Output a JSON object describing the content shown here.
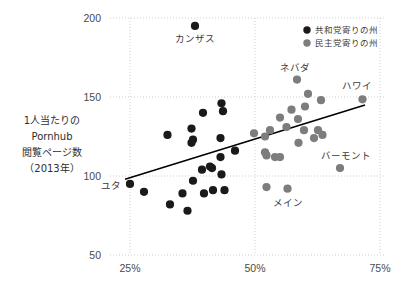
{
  "chart_data": {
    "type": "scatter",
    "title": "",
    "xlabel": "",
    "ylabel": "1人当たりのPornhub閲覧ページ数（2013年）",
    "xlim": [
      21,
      76
    ],
    "ylim": [
      50,
      200
    ],
    "xtick_labels": [
      "25%",
      "50%",
      "75%"
    ],
    "xtick_values": [
      25,
      50,
      75
    ],
    "ytick_labels": [
      "200",
      "150",
      "100",
      "50"
    ],
    "ytick_values": [
      200,
      150,
      100,
      50
    ],
    "grid": true,
    "legend_position": "top-right",
    "colors": {
      "republican": "#1a1a1a",
      "democrat": "#7d7d7d",
      "trendline": "#000000",
      "gridline": "#cfcfcf",
      "background": "#ffffff"
    },
    "series": [
      {
        "name": "共和党寄りの州",
        "color": "#1a1a1a",
        "points": [
          {
            "x": 38.0,
            "y": 195.0,
            "label": "カンザス"
          },
          {
            "x": 25.0,
            "y": 95.0,
            "label": "ユタ"
          },
          {
            "x": 27.8,
            "y": 90.0
          },
          {
            "x": 32.5,
            "y": 126.0
          },
          {
            "x": 33.0,
            "y": 82.0
          },
          {
            "x": 35.5,
            "y": 89.0
          },
          {
            "x": 36.5,
            "y": 78.0
          },
          {
            "x": 37.3,
            "y": 130.0
          },
          {
            "x": 37.3,
            "y": 121.0
          },
          {
            "x": 37.6,
            "y": 123.0
          },
          {
            "x": 37.6,
            "y": 97.0
          },
          {
            "x": 39.6,
            "y": 140.0
          },
          {
            "x": 39.4,
            "y": 104.0
          },
          {
            "x": 39.8,
            "y": 89.0
          },
          {
            "x": 41.0,
            "y": 106.0
          },
          {
            "x": 41.4,
            "y": 105.0
          },
          {
            "x": 41.6,
            "y": 91.0
          },
          {
            "x": 43.3,
            "y": 146.0
          },
          {
            "x": 43.6,
            "y": 141.0
          },
          {
            "x": 43.1,
            "y": 124.0
          },
          {
            "x": 43.1,
            "y": 112.0
          },
          {
            "x": 43.3,
            "y": 101.0
          },
          {
            "x": 43.9,
            "y": 91.0
          },
          {
            "x": 46.0,
            "y": 116.0
          }
        ]
      },
      {
        "name": "民主党寄りの州",
        "color": "#7d7d7d",
        "points": [
          {
            "x": 58.4,
            "y": 161.0,
            "label": "ネバダ"
          },
          {
            "x": 71.5,
            "y": 148.5,
            "label": "ハワイ"
          },
          {
            "x": 67.0,
            "y": 105.0,
            "label": "バーモント"
          },
          {
            "x": 56.5,
            "y": 92.0,
            "label": "メイン"
          },
          {
            "x": 52.3,
            "y": 93.0
          },
          {
            "x": 60.6,
            "y": 152.0
          },
          {
            "x": 63.2,
            "y": 148.0
          },
          {
            "x": 57.3,
            "y": 142.0
          },
          {
            "x": 60.0,
            "y": 144.0
          },
          {
            "x": 55.0,
            "y": 137.0
          },
          {
            "x": 58.6,
            "y": 136.0
          },
          {
            "x": 56.3,
            "y": 131.0
          },
          {
            "x": 49.8,
            "y": 127.0
          },
          {
            "x": 53.0,
            "y": 129.0
          },
          {
            "x": 52.0,
            "y": 125.0
          },
          {
            "x": 59.8,
            "y": 129.0
          },
          {
            "x": 62.6,
            "y": 129.0
          },
          {
            "x": 63.5,
            "y": 126.0
          },
          {
            "x": 61.8,
            "y": 124.0
          },
          {
            "x": 58.7,
            "y": 121.0
          },
          {
            "x": 52.0,
            "y": 115.0
          },
          {
            "x": 52.3,
            "y": 113.0
          },
          {
            "x": 54.0,
            "y": 112.0
          },
          {
            "x": 55.0,
            "y": 112.0
          }
        ]
      }
    ],
    "trendline": {
      "x1": 24.0,
      "y1": 98.0,
      "x2": 72.0,
      "y2": 145.0
    },
    "annotations": [
      {
        "text": "カンザス",
        "x": 38.0,
        "y": 195.0
      },
      {
        "text": "ネバダ",
        "x": 58.4,
        "y": 161.0
      },
      {
        "text": "ハワイ",
        "x": 71.5,
        "y": 148.5
      },
      {
        "text": "バーモント",
        "x": 67.0,
        "y": 105.0
      },
      {
        "text": "メイン",
        "x": 56.5,
        "y": 92.0
      },
      {
        "text": "ユタ",
        "x": 25.0,
        "y": 95.0
      }
    ]
  },
  "ylabel_lines": [
    "1人当たりの",
    "Pornhub",
    "閲覧ページ数",
    "（2013年）"
  ],
  "legend": {
    "items": [
      {
        "label": "共和党寄りの州",
        "color": "#1a1a1a"
      },
      {
        "label": "民主党寄りの州",
        "color": "#7d7d7d"
      }
    ]
  }
}
